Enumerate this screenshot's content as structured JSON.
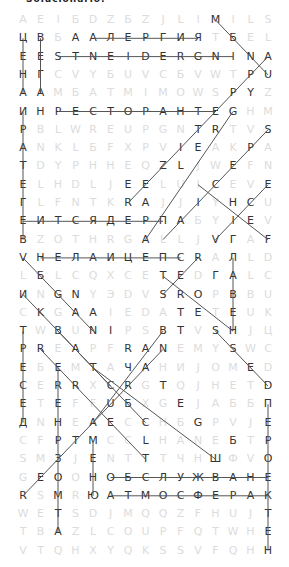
{
  "puzzle": {
    "title": "Solucionario:",
    "cols": 15,
    "rows": 30,
    "origin_x": 23,
    "origin_y": 20,
    "pitch_x": 17.5,
    "pitch_y": 18.3,
    "grid": [
      "AEIБDZБZJLIMILS",
      "ЦВБAАЛЕРГИЯTБEL",
      "ЕЕSTNEIDERGNINA",
      "НГCVYБUVCБVWTРU",
      "ААMБATMIMOWSPYZ",
      "ИНРЕСТОРАНТЕGHM",
      "РBLWREUPGNTRTVS",
      "АNKLБFXPVIEAKPA",
      "ТDYPHHEQZLJWEFN",
      "ЕLHDLJEELUICEVE",
      "ГLFNTKRAJJIYHCU",
      "ЕИТСЯДЕРПАБYIEV",
      "ВZOTHRGALLJVГAF",
      "VНЕЛАИЦЕПСRAЛLD",
      "LБLCQXCETEDГАLC",
      "ИNGNYЭDVSROPВBU",
      "CKGAAIEDATETЕUK",
      "ТWBUNIPSBTVSНJЦ",
      "РREAPFRANEMYSWC",
      "ЕБЕMTAЧAHИJOMED",
      "СERRXCRGTQJHETD",
      "ЕTЕFFUБXGEJAББП",
      "ДNНEAECCHБGPVJЕ",
      "CFРTМCCLHANEБTР",
      "SMЗJENTTTЧНШФVО",
      "GЕООНОБСЛУЖВАНЕ",
      "RSМRЮАТМОСФЕРАК",
      "WETSDJMQQZFHUJТ",
      "TBAZLCOUPFQTWHЕ",
      "VTQHXYQKSSVFQHН"
    ],
    "found_words": [
      {
        "word": "АЛЕРГИЯ",
        "from": [
          1,
          4
        ],
        "to": [
          1,
          10
        ]
      },
      {
        "word": "INGREDIENTS",
        "from": [
          2,
          12
        ],
        "to": [
          2,
          2
        ]
      },
      {
        "word": "РЕСТОРАНТЕ",
        "from": [
          5,
          2
        ],
        "to": [
          5,
          11
        ]
      },
      {
        "word": "ЦЕНА",
        "from": [
          1,
          0
        ],
        "to": [
          4,
          0
        ]
      },
      {
        "word": "ВЕГА",
        "from": [
          1,
          1
        ],
        "to": [
          4,
          1
        ]
      },
      {
        "word": "ИРАТЕГЕВ",
        "from": [
          5,
          0
        ],
        "to": [
          12,
          0
        ]
      },
      {
        "word": "ЕИТСЯДЕРП",
        "from": [
          11,
          0
        ],
        "to": [
          11,
          8
        ]
      },
      {
        "word": "НЕЛАИЦЕПС",
        "from": [
          13,
          1
        ],
        "to": [
          13,
          9
        ]
      },
      {
        "word": "ЛАВЕН",
        "from": [
          13,
          12
        ],
        "to": [
          17,
          12
        ]
      },
      {
        "word": "ОБСЛУЖВАНЕ",
        "from": [
          25,
          5
        ],
        "to": [
          25,
          14
        ]
      },
      {
        "word": "АТМОСФЕРАК",
        "from": [
          26,
          5
        ],
        "to": [
          26,
          14
        ]
      },
      {
        "word": "ТРЕСЕД",
        "from": [
          17,
          0
        ],
        "to": [
          22,
          0
        ]
      },
      {
        "word": "ПЕРОЕКТЕН",
        "from": [
          21,
          14
        ],
        "to": [
          29,
          14
        ]
      },
      {
        "word": "НРЗОМТА",
        "from": [
          22,
          2
        ],
        "to": [
          28,
          2
        ]
      },
      {
        "word": "МЕНЮ",
        "from": [
          23,
          4
        ],
        "to": [
          26,
          4
        ]
      },
      {
        "word": "ЕЕРЕН",
        "from": [
          19,
          2
        ],
        "to": [
          22,
          2
        ]
      },
      {
        "word": "MENU",
        "from": [
          0,
          11
        ],
        "to": [
          3,
          14
        ]
      },
      {
        "word": "APPETIZER",
        "from": [
          2,
          14
        ],
        "to": [
          10,
          6
        ]
      },
      {
        "word": "GRILLED",
        "from": [
          5,
          12
        ],
        "to": [
          12,
          7
        ]
      },
      {
        "word": "SPECIAL",
        "from": [
          6,
          14
        ],
        "to": [
          12,
          8
        ]
      },
      {
        "word": "CHEF",
        "from": [
          9,
          10
        ],
        "to": [
          12,
          14
        ]
      },
      {
        "word": "EVIE",
        "from": [
          9,
          14
        ],
        "to": [
          12,
          11
        ]
      },
      {
        "word": "REGRET",
        "from": [
          13,
          10
        ],
        "to": [
          15,
          8
        ]
      },
      {
        "word": "ТЕSRО",
        "from": [
          14,
          8
        ],
        "to": [
          17,
          12
        ]
      },
      {
        "word": "VEGAN",
        "from": [
          13,
          0
        ],
        "to": [
          17,
          4
        ]
      },
      {
        "word": "INGREDIENTS-2",
        "from": [
          15,
          0
        ],
        "to": [
          20,
          5
        ]
      },
      {
        "word": "BUNAT",
        "from": [
          17,
          2
        ],
        "to": [
          22,
          7
        ]
      },
      {
        "word": "BREAD",
        "from": [
          17,
          8
        ],
        "to": [
          22,
          4
        ]
      },
      {
        "word": "SAUCE",
        "from": [
          17,
          11
        ],
        "to": [
          20,
          14
        ]
      },
      {
        "word": "RECIPE",
        "from": [
          18,
          1
        ],
        "to": [
          24,
          7
        ]
      },
      {
        "word": "TASTEGV",
        "from": [
          19,
          4
        ],
        "to": [
          24,
          11
        ]
      },
      {
        "word": "BAREFOOT",
        "from": [
          18,
          8
        ],
        "to": [
          26,
          0
        ]
      }
    ],
    "found_cells": [
      [
        0,
        11
      ],
      [
        1,
        0
      ],
      [
        1,
        1
      ],
      [
        1,
        3
      ],
      [
        1,
        4
      ],
      [
        1,
        5
      ],
      [
        1,
        6
      ],
      [
        1,
        7
      ],
      [
        1,
        8
      ],
      [
        1,
        9
      ],
      [
        1,
        10
      ],
      [
        1,
        12
      ],
      [
        2,
        0
      ],
      [
        2,
        1
      ],
      [
        2,
        2
      ],
      [
        2,
        3
      ],
      [
        2,
        4
      ],
      [
        2,
        5
      ],
      [
        2,
        6
      ],
      [
        2,
        7
      ],
      [
        2,
        8
      ],
      [
        2,
        9
      ],
      [
        2,
        10
      ],
      [
        2,
        11
      ],
      [
        2,
        12
      ],
      [
        2,
        13
      ],
      [
        2,
        14
      ],
      [
        3,
        0
      ],
      [
        3,
        1
      ],
      [
        3,
        13
      ],
      [
        3,
        14
      ],
      [
        4,
        0
      ],
      [
        4,
        1
      ],
      [
        4,
        12
      ],
      [
        4,
        13
      ],
      [
        5,
        0
      ],
      [
        5,
        1
      ],
      [
        5,
        2
      ],
      [
        5,
        3
      ],
      [
        5,
        4
      ],
      [
        5,
        5
      ],
      [
        5,
        6
      ],
      [
        5,
        7
      ],
      [
        5,
        8
      ],
      [
        5,
        9
      ],
      [
        5,
        10
      ],
      [
        5,
        11
      ],
      [
        5,
        12
      ],
      [
        6,
        0
      ],
      [
        6,
        10
      ],
      [
        6,
        11
      ],
      [
        6,
        14
      ],
      [
        7,
        0
      ],
      [
        7,
        9
      ],
      [
        7,
        10
      ],
      [
        7,
        13
      ],
      [
        8,
        0
      ],
      [
        8,
        8
      ],
      [
        8,
        9
      ],
      [
        8,
        12
      ],
      [
        9,
        0
      ],
      [
        9,
        6
      ],
      [
        9,
        7
      ],
      [
        9,
        11
      ],
      [
        9,
        14
      ],
      [
        10,
        0
      ],
      [
        10,
        6
      ],
      [
        10,
        7
      ],
      [
        10,
        10
      ],
      [
        10,
        12
      ],
      [
        10,
        13
      ],
      [
        11,
        0
      ],
      [
        11,
        1
      ],
      [
        11,
        2
      ],
      [
        11,
        3
      ],
      [
        11,
        4
      ],
      [
        11,
        5
      ],
      [
        11,
        6
      ],
      [
        11,
        7
      ],
      [
        11,
        8
      ],
      [
        11,
        9
      ],
      [
        11,
        12
      ],
      [
        11,
        13
      ],
      [
        12,
        0
      ],
      [
        12,
        7
      ],
      [
        12,
        11
      ],
      [
        12,
        12
      ],
      [
        12,
        14
      ],
      [
        13,
        0
      ],
      [
        13,
        1
      ],
      [
        13,
        2
      ],
      [
        13,
        3
      ],
      [
        13,
        4
      ],
      [
        13,
        5
      ],
      [
        13,
        6
      ],
      [
        13,
        7
      ],
      [
        13,
        8
      ],
      [
        13,
        9
      ],
      [
        13,
        10
      ],
      [
        13,
        12
      ],
      [
        14,
        1
      ],
      [
        14,
        8
      ],
      [
        14,
        9
      ],
      [
        14,
        11
      ],
      [
        14,
        12
      ],
      [
        15,
        0
      ],
      [
        15,
        2
      ],
      [
        15,
        3
      ],
      [
        15,
        8
      ],
      [
        15,
        9
      ],
      [
        15,
        10
      ],
      [
        15,
        12
      ],
      [
        16,
        1
      ],
      [
        16,
        3
      ],
      [
        16,
        4
      ],
      [
        16,
        9
      ],
      [
        16,
        10
      ],
      [
        16,
        12
      ],
      [
        17,
        0
      ],
      [
        17,
        2
      ],
      [
        17,
        4
      ],
      [
        17,
        5
      ],
      [
        17,
        8
      ],
      [
        17,
        9
      ],
      [
        17,
        11
      ],
      [
        17,
        12
      ],
      [
        18,
        0
      ],
      [
        18,
        1
      ],
      [
        18,
        3
      ],
      [
        18,
        6
      ],
      [
        18,
        7
      ],
      [
        18,
        8
      ],
      [
        18,
        12
      ],
      [
        19,
        0
      ],
      [
        19,
        2
      ],
      [
        19,
        4
      ],
      [
        19,
        6
      ],
      [
        19,
        7
      ],
      [
        19,
        13
      ],
      [
        20,
        0
      ],
      [
        20,
        2
      ],
      [
        20,
        3
      ],
      [
        20,
        5
      ],
      [
        20,
        6
      ],
      [
        20,
        8
      ],
      [
        20,
        14
      ],
      [
        21,
        0
      ],
      [
        21,
        2
      ],
      [
        21,
        5
      ],
      [
        21,
        6
      ],
      [
        21,
        9
      ],
      [
        21,
        14
      ],
      [
        22,
        0
      ],
      [
        22,
        2
      ],
      [
        22,
        4
      ],
      [
        22,
        5
      ],
      [
        22,
        7
      ],
      [
        22,
        10
      ],
      [
        22,
        14
      ],
      [
        23,
        2
      ],
      [
        23,
        3
      ],
      [
        23,
        4
      ],
      [
        23,
        7
      ],
      [
        23,
        12
      ],
      [
        23,
        14
      ],
      [
        24,
        2
      ],
      [
        24,
        4
      ],
      [
        24,
        7
      ],
      [
        24,
        11
      ],
      [
        24,
        14
      ],
      [
        25,
        1
      ],
      [
        25,
        2
      ],
      [
        25,
        4
      ],
      [
        25,
        5
      ],
      [
        25,
        6
      ],
      [
        25,
        7
      ],
      [
        25,
        8
      ],
      [
        25,
        9
      ],
      [
        25,
        10
      ],
      [
        25,
        11
      ],
      [
        25,
        12
      ],
      [
        25,
        13
      ],
      [
        25,
        14
      ],
      [
        26,
        0
      ],
      [
        26,
        2
      ],
      [
        26,
        4
      ],
      [
        26,
        5
      ],
      [
        26,
        6
      ],
      [
        26,
        7
      ],
      [
        26,
        8
      ],
      [
        26,
        9
      ],
      [
        26,
        10
      ],
      [
        26,
        11
      ],
      [
        26,
        12
      ],
      [
        26,
        13
      ],
      [
        26,
        14
      ],
      [
        27,
        2
      ],
      [
        27,
        14
      ],
      [
        28,
        2
      ],
      [
        28,
        14
      ],
      [
        29,
        14
      ]
    ],
    "colors": {
      "found_letter": "#333333",
      "faint_letter": "#dcdcdc",
      "line": "#555555",
      "background": "#ffffff"
    }
  }
}
